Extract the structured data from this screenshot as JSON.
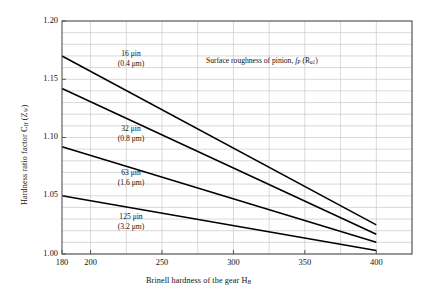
{
  "chart_data": {
    "type": "line",
    "title": "",
    "xlabel": "Brinell hardness of the gear H_B",
    "ylabel": "Hardness ratio factor C_H (Z_W)",
    "xlim": [
      180,
      425
    ],
    "ylim": [
      1.0,
      1.2
    ],
    "xticks": [
      180,
      200,
      250,
      300,
      350,
      400
    ],
    "xticklabels": [
      "180",
      "200",
      "250",
      "300",
      "350",
      "400"
    ],
    "yticks": [
      1.0,
      1.05,
      1.1,
      1.15,
      1.2
    ],
    "yticklabels": [
      "1.00",
      "1.05",
      "1.10",
      "1.15",
      "1.20"
    ],
    "y_minor_step": 0.01,
    "x_minor_step": 25,
    "grid": true,
    "legend_position": "inline-annotations",
    "annotations": [
      {
        "name": "surface-roughness-note",
        "text_line1": "Surface roughness of pinion, f_P (R_a1)",
        "x": 300,
        "y": 1.168
      }
    ],
    "series": [
      {
        "name": "16 uin (0.4 um)",
        "label_line1": "16 μin",
        "label_line2": "(0.4 μm)",
        "x": [
          180,
          400
        ],
        "values": [
          1.17,
          1.025
        ]
      },
      {
        "name": "32 uin (0.8 um)",
        "label_line1": "32 μin",
        "label_line2": "(0.8 μm)",
        "x": [
          180,
          400
        ],
        "values": [
          1.142,
          1.017
        ]
      },
      {
        "name": "63 uin (1.6 um)",
        "label_line1": "63 μin",
        "label_line2": "(1.6 μm)",
        "x": [
          180,
          400
        ],
        "values": [
          1.092,
          1.01
        ]
      },
      {
        "name": "125 uin (3.2 um)",
        "label_line1": "125 μin",
        "label_line2": "(3.2 μm)",
        "x": [
          180,
          400
        ],
        "values": [
          1.05,
          1.003
        ]
      }
    ]
  },
  "axis": {
    "y_title_plain": "Hardness ratio factor C",
    "y_title_sub": "H",
    "y_title_tail": " (Z",
    "y_title_sub2": "W",
    "y_title_close": ")",
    "x_title_plain": "Brinell hardness of the gear H",
    "x_title_sub": "B"
  },
  "note": {
    "prefix": "Surface roughness of pinion, ",
    "f": "f",
    "f_sub": "P",
    "mid": " (R",
    "r_sub": "a1",
    "close": ")"
  },
  "colors": {
    "line": "#000000",
    "grid": "#c9c9c9",
    "frame": "#555555",
    "text": "#111111",
    "background": "#ffffff"
  }
}
